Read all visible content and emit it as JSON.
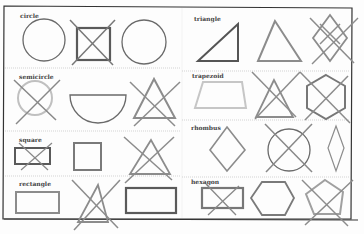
{
  "worksheet": {
    "title_fragment": "",
    "sections": [
      {
        "label": "circle",
        "items": [
          "circle",
          "square (crossed out)",
          "circle"
        ]
      },
      {
        "label": "semicircle",
        "items": [
          "circle (crossed out)",
          "semicircle",
          "triangle (crossed out)"
        ]
      },
      {
        "label": "square",
        "items": [
          "rectangle (crossed out)",
          "square",
          "triangle (crossed out)"
        ]
      },
      {
        "label": "rectangle",
        "items": [
          "rectangle",
          "triangle (crossed out)",
          "rectangle"
        ]
      },
      {
        "label": "triangle",
        "items": [
          "right triangle",
          "triangle",
          "rhombus pattern (crossed out)"
        ]
      },
      {
        "label": "trapezoid",
        "items": [
          "trapezoid",
          "triangle (crossed out)",
          "hexagon (crossed out)"
        ]
      },
      {
        "label": "rhombus",
        "items": [
          "rhombus",
          "circle (crossed out)",
          "rhombus"
        ]
      },
      {
        "label": "hexagon",
        "items": [
          "rectangle (crossed out)",
          "hexagon",
          "pentagon (crossed out)"
        ]
      }
    ]
  },
  "colors": {
    "border": "#333333",
    "shape_dark": "#6a6a6a",
    "shape_mid": "#8c8c8c",
    "shape_light": "#bdbdbd",
    "divider": "#bbbbbb"
  }
}
